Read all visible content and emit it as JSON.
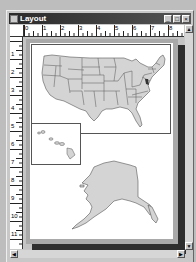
{
  "window": {
    "title": "Layout",
    "buttons": {
      "minimize": "_",
      "maximize": "□",
      "close": "×"
    }
  },
  "rulers": {
    "horizontal": [
      "0",
      "1",
      "2",
      "3",
      "4",
      "5",
      "6",
      "7",
      "8"
    ],
    "vertical": [
      "1",
      "2",
      "3",
      "4",
      "5",
      "6",
      "7",
      "8",
      "9",
      "10",
      "11"
    ]
  },
  "layout": {
    "panels": [
      {
        "name": "contiguous-us-map",
        "label": "Contiguous United States"
      },
      {
        "name": "hawaii-inset",
        "label": "Hawaii"
      },
      {
        "name": "alaska-map",
        "label": "Alaska"
      }
    ]
  },
  "colors": {
    "state_fill": "#d4d4d4",
    "state_stroke": "#555555",
    "page_border": "#a9a9a9",
    "page_shadow": "#2e2e2e"
  }
}
